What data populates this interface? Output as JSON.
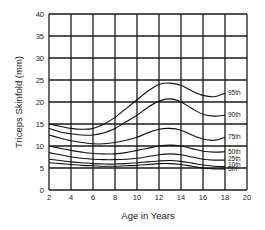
{
  "chart_data": {
    "type": "line",
    "title": "",
    "xlabel": "Age in Years",
    "ylabel": "Triceps Skinfold (mm)",
    "xlim": [
      2,
      20
    ],
    "ylim": [
      0,
      40
    ],
    "xticks": [
      2,
      4,
      6,
      8,
      10,
      12,
      14,
      16,
      18,
      20
    ],
    "yticks": [
      0,
      5,
      10,
      15,
      20,
      25,
      30,
      35,
      40
    ],
    "grid": true,
    "legend": "inline-right",
    "x": [
      2,
      3,
      4,
      5,
      6,
      7,
      8,
      9,
      10,
      11,
      12,
      13,
      14,
      15,
      16,
      17,
      18
    ],
    "series": [
      {
        "name": "95th",
        "values": [
          15,
          14.5,
          14,
          13.8,
          14,
          15,
          16.5,
          18.5,
          20.5,
          22.5,
          24,
          24.3,
          23.8,
          22.5,
          21.5,
          21.2,
          22
        ]
      },
      {
        "name": "90th",
        "values": [
          14,
          13.2,
          12.8,
          12.5,
          12.5,
          13,
          14,
          15.5,
          17,
          18.8,
          20.2,
          20.7,
          20,
          18.5,
          17.2,
          16.8,
          17
        ]
      },
      {
        "name": "75th",
        "values": [
          12.5,
          11.8,
          11.2,
          10.8,
          10.5,
          10.5,
          10.8,
          11.3,
          12,
          13,
          13.8,
          14,
          13.6,
          12.5,
          11.6,
          11.3,
          12
        ]
      },
      {
        "name": "50th",
        "values": [
          10,
          9.5,
          9,
          8.6,
          8.3,
          8.2,
          8.2,
          8.5,
          9,
          9.5,
          10,
          10.2,
          10,
          9.4,
          8.8,
          8.6,
          8.7
        ]
      },
      {
        "name": "25th",
        "values": [
          8.5,
          8,
          7.5,
          7.2,
          7,
          6.9,
          6.9,
          7,
          7.2,
          7.6,
          8,
          8.2,
          8,
          7.5,
          7,
          6.8,
          6.8
        ]
      },
      {
        "name": "10th",
        "values": [
          7,
          6.7,
          6.4,
          6.2,
          6,
          5.9,
          5.9,
          6,
          6.2,
          6.4,
          6.6,
          6.7,
          6.5,
          6.1,
          5.7,
          5.4,
          5.3
        ]
      },
      {
        "name": "5th",
        "values": [
          6.2,
          6,
          5.8,
          5.6,
          5.5,
          5.4,
          5.4,
          5.5,
          5.6,
          5.8,
          6,
          6,
          5.8,
          5.4,
          5,
          4.8,
          4.8
        ]
      }
    ],
    "label_values": {
      "95th": 22,
      "90th": 17,
      "75th": 12,
      "50th": 8.7,
      "25th": 7,
      "10th": 5.8,
      "5th": 4.8
    }
  }
}
